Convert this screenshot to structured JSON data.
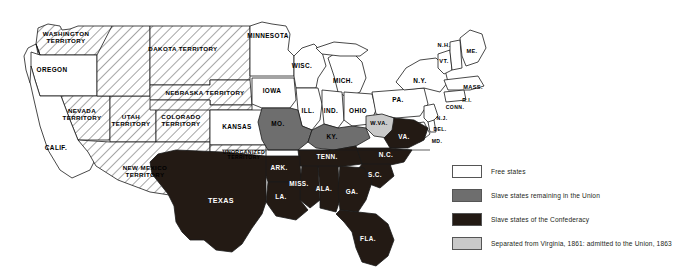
{
  "map": {
    "title": "The United States on the Eve of the Civil War",
    "colors": {
      "free_states": "#ffffff",
      "union_slave_states": "#6e6e6e",
      "confederacy": "#231a14",
      "separated_from_virginia": "#c9c9c9",
      "territory_hatch": "#ffffff",
      "outline": "#1a1a1a"
    },
    "regions": [
      {
        "id": "washington-territory",
        "label": "WASHINGTON\nTERRITORY",
        "category": "territory",
        "x": 66,
        "y": 37,
        "size": "s-terr"
      },
      {
        "id": "oregon",
        "label": "OREGON",
        "category": "free",
        "x": 52,
        "y": 70,
        "size": "s-state"
      },
      {
        "id": "nevada-territory",
        "label": "NEVADA\nTERRITORY",
        "category": "territory",
        "x": 82,
        "y": 114,
        "size": "s-terr"
      },
      {
        "id": "utah-territory",
        "label": "UTAH\nTERRITORY",
        "category": "territory",
        "x": 131,
        "y": 120,
        "size": "s-terr"
      },
      {
        "id": "colorado-territory",
        "label": "COLORADO\nTERRITORY",
        "category": "territory",
        "x": 181,
        "y": 120,
        "size": "s-terr"
      },
      {
        "id": "california",
        "label": "CALIF.",
        "category": "free",
        "x": 56,
        "y": 148,
        "size": "s-state"
      },
      {
        "id": "new-mexico-territory",
        "label": "NEW MEXICO\nTERRITORY",
        "category": "territory",
        "x": 145,
        "y": 171,
        "size": "s-terr"
      },
      {
        "id": "dakota-territory",
        "label": "DAKOTA TERRITORY",
        "category": "territory",
        "x": 183,
        "y": 49,
        "size": "s-terr"
      },
      {
        "id": "nebraska-territory",
        "label": "NEBRASKA TERRITORY",
        "category": "territory",
        "x": 205,
        "y": 93,
        "size": "s-terr"
      },
      {
        "id": "kansas",
        "label": "KANSAS",
        "category": "free",
        "x": 237,
        "y": 127,
        "size": "s-state"
      },
      {
        "id": "unorganized-territory",
        "label": "UNORGANIZED\nTERRITORY",
        "category": "territory",
        "x": 244,
        "y": 155,
        "size": "s-tiny"
      },
      {
        "id": "minnesota",
        "label": "MINNESOTA",
        "category": "free",
        "x": 268,
        "y": 36,
        "size": "s-state"
      },
      {
        "id": "iowa",
        "label": "IOWA",
        "category": "free",
        "x": 272,
        "y": 91,
        "size": "s-state"
      },
      {
        "id": "wisconsin",
        "label": "WISC.",
        "category": "free",
        "x": 302,
        "y": 66,
        "size": "s-state"
      },
      {
        "id": "michigan",
        "label": "MICH.",
        "category": "free",
        "x": 343,
        "y": 81,
        "size": "s-state"
      },
      {
        "id": "illinois",
        "label": "ILL.",
        "category": "free",
        "x": 308,
        "y": 111,
        "size": "s-state"
      },
      {
        "id": "indiana",
        "label": "IND.",
        "category": "free",
        "x": 331,
        "y": 111,
        "size": "s-state"
      },
      {
        "id": "ohio",
        "label": "OHIO",
        "category": "free",
        "x": 358,
        "y": 111,
        "size": "s-state"
      },
      {
        "id": "missouri",
        "label": "MO.",
        "category": "union-slave",
        "x": 278,
        "y": 124,
        "size": "s-state"
      },
      {
        "id": "kentucky",
        "label": "KY.",
        "category": "union-slave",
        "x": 332,
        "y": 137,
        "size": "s-state"
      },
      {
        "id": "west-virginia",
        "label": "W.VA.",
        "category": "separated",
        "x": 379,
        "y": 124,
        "size": "s-small"
      },
      {
        "id": "virginia",
        "label": "VA.",
        "category": "confederacy",
        "x": 404,
        "y": 137,
        "size": "s-state"
      },
      {
        "id": "pennsylvania",
        "label": "PA.",
        "category": "free",
        "x": 398,
        "y": 100,
        "size": "s-state"
      },
      {
        "id": "new-york",
        "label": "N.Y.",
        "category": "free",
        "x": 420,
        "y": 81,
        "size": "s-state"
      },
      {
        "id": "vermont",
        "label": "VT.",
        "category": "free",
        "x": 444,
        "y": 62,
        "size": "s-small"
      },
      {
        "id": "new-hampshire",
        "label": "N.H.",
        "category": "free",
        "x": 444,
        "y": 46,
        "size": "s-small"
      },
      {
        "id": "maine",
        "label": "ME.",
        "category": "free",
        "x": 472,
        "y": 52,
        "size": "s-small"
      },
      {
        "id": "massachusetts",
        "label": "MASS.",
        "category": "free",
        "x": 473,
        "y": 88,
        "size": "s-small"
      },
      {
        "id": "rhode-island",
        "label": "R.I.",
        "category": "free",
        "x": 467,
        "y": 101,
        "size": "s-tiny"
      },
      {
        "id": "connecticut",
        "label": "CONN.",
        "category": "free",
        "x": 455,
        "y": 108,
        "size": "s-tiny"
      },
      {
        "id": "new-jersey",
        "label": "N.J.",
        "category": "free",
        "x": 442,
        "y": 119,
        "size": "s-tiny"
      },
      {
        "id": "delaware",
        "label": "DEL.",
        "category": "free",
        "x": 440,
        "y": 130,
        "size": "s-tiny"
      },
      {
        "id": "maryland",
        "label": "MD.",
        "category": "free",
        "x": 437,
        "y": 142,
        "size": "s-tiny"
      },
      {
        "id": "north-carolina",
        "label": "N.C.",
        "category": "confederacy",
        "x": 386,
        "y": 155,
        "size": "s-state"
      },
      {
        "id": "south-carolina",
        "label": "S.C.",
        "category": "confederacy",
        "x": 375,
        "y": 175,
        "size": "s-state"
      },
      {
        "id": "tennessee",
        "label": "TENN.",
        "category": "confederacy",
        "x": 327,
        "y": 157,
        "size": "s-state"
      },
      {
        "id": "arkansas",
        "label": "ARK.",
        "category": "confederacy",
        "x": 279,
        "y": 168,
        "size": "s-state"
      },
      {
        "id": "mississippi",
        "label": "MISS.",
        "category": "confederacy",
        "x": 299,
        "y": 184,
        "size": "s-state"
      },
      {
        "id": "alabama",
        "label": "ALA.",
        "category": "confederacy",
        "x": 324,
        "y": 189,
        "size": "s-state"
      },
      {
        "id": "georgia",
        "label": "GA.",
        "category": "confederacy",
        "x": 352,
        "y": 192,
        "size": "s-state"
      },
      {
        "id": "louisiana",
        "label": "LA.",
        "category": "confederacy",
        "x": 281,
        "y": 197,
        "size": "s-state"
      },
      {
        "id": "texas",
        "label": "TEXAS",
        "category": "confederacy",
        "x": 221,
        "y": 201,
        "size": "s-big"
      },
      {
        "id": "florida",
        "label": "FLA.",
        "category": "confederacy",
        "x": 368,
        "y": 239,
        "size": "s-state"
      }
    ]
  },
  "legend": {
    "items": [
      {
        "id": "free-states",
        "label": "Free states",
        "color": "#ffffff"
      },
      {
        "id": "union-slave-states",
        "label": "Slave states remaining in the Union",
        "color": "#6e6e6e"
      },
      {
        "id": "confederacy",
        "label": "Slave states of the Confederacy",
        "color": "#231a14"
      },
      {
        "id": "separated-virginia",
        "label": "Separated from Virginia, 1861: admitted to the Union, 1863",
        "color": "#c9c9c9"
      }
    ]
  }
}
